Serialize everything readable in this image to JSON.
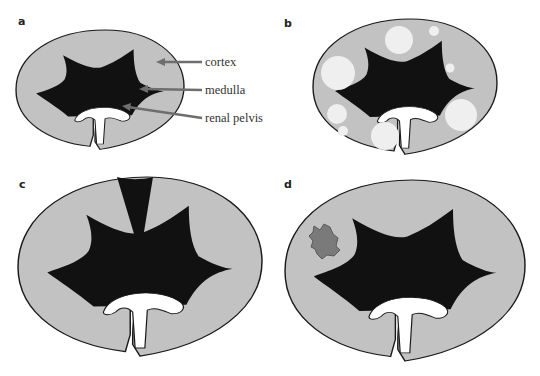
{
  "figure": {
    "colors": {
      "cortex": "#c2c2c2",
      "medulla": "#111111",
      "pelvis": "#ffffff",
      "outline": "#1a1a1a",
      "arrow": "#6e6e6e",
      "cyst": "#efefef",
      "lesion": "#7a7a7a"
    },
    "panels": [
      {
        "letter": "a",
        "labels": [
          {
            "text": "cortex"
          },
          {
            "text": "medulla"
          },
          {
            "text": "renal pelvis"
          }
        ]
      },
      {
        "letter": "b",
        "feature": "multiple round cysts in cortex"
      },
      {
        "letter": "c",
        "feature": "dark wedge-shaped defect through cortex"
      },
      {
        "letter": "d",
        "feature": "irregular focal lesion in cortex"
      }
    ]
  }
}
